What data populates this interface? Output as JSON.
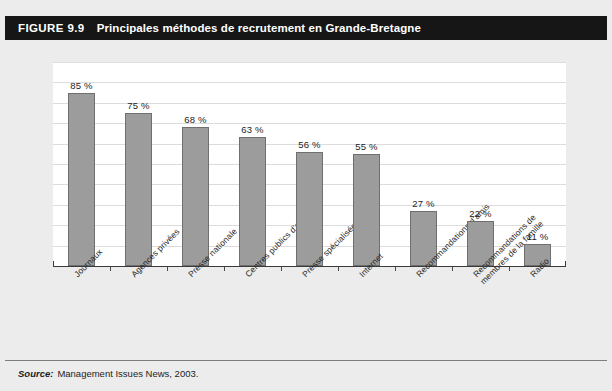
{
  "figure": {
    "number": "FIGURE 9.9",
    "title": "Principales méthodes de recrutement en Grande-Bretagne"
  },
  "footer": {
    "source_label": "Source:",
    "source_text": "Management Issues News, 2003."
  },
  "chart_data": {
    "type": "bar",
    "title": "Principales méthodes de recrutement en Grande-Bretagne",
    "xlabel": "",
    "ylabel": "",
    "ylim": [
      0,
      100
    ],
    "grid": true,
    "legend": "none",
    "orientation": "vertical",
    "bar_color": "#9c9c9c",
    "bar_edge_color": "#6f6f6f",
    "gridline_color": "#dcdcdc",
    "plot_background": "#ffffff",
    "page_background": "#ececec",
    "header_background": "#161616",
    "categories": [
      "Journaux",
      "Agences privées",
      "Presse nationale",
      "Centres publics d'emploi",
      "Presse spécialisée",
      "Internet",
      "Recommandations d'amis",
      "Recommandations de membres de la famille",
      "Radio"
    ],
    "category_lines": [
      [
        "Journaux"
      ],
      [
        "Agences privées"
      ],
      [
        "Presse nationale"
      ],
      [
        "Centres publics d'emploi"
      ],
      [
        "Presse spécialisée"
      ],
      [
        "Internet"
      ],
      [
        "Recommandations d'amis"
      ],
      [
        "Recommandations de",
        "membres de la famille"
      ],
      [
        "Radio"
      ]
    ],
    "values": [
      85,
      75,
      68,
      63,
      56,
      55,
      27,
      22,
      11
    ],
    "value_labels": [
      "85 %",
      "75 %",
      "68 %",
      "63 %",
      "56 %",
      "55 %",
      "27 %",
      "22 %",
      "11 %"
    ],
    "gridline_values": [
      10,
      20,
      30,
      40,
      50,
      60,
      70,
      80,
      90,
      100
    ]
  }
}
